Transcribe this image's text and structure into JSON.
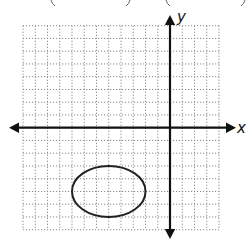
{
  "figure": {
    "type": "coordinate-plane",
    "x_axis_label": "x",
    "y_axis_label": "y",
    "grid": {
      "x_min": -12,
      "x_max": 4,
      "y_min": -8,
      "y_max": 8,
      "step": 1,
      "line_style": "dotted"
    },
    "top_cropped_text_fragments": [
      "(",
      ")",
      "(",
      ")"
    ],
    "shapes": [
      {
        "type": "ellipse",
        "center": [
          -5,
          -5
        ],
        "rx": 3,
        "ry": 2,
        "stroke": "#222222",
        "fill": "none"
      }
    ],
    "colors": {
      "axis": "#111111",
      "grid": "#8a8a8a",
      "curve": "#222222"
    }
  }
}
